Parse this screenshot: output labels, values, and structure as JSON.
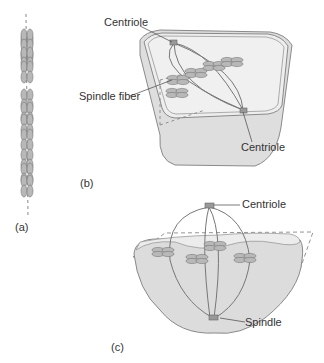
{
  "panels": {
    "a": {
      "label": "(a)"
    },
    "b": {
      "label": "(b)",
      "callouts": {
        "centriole_top": "Centriole",
        "spindle_fiber": "Spindle fiber",
        "centriole_bottom": "Centriole"
      }
    },
    "c": {
      "label": "(c)",
      "callouts": {
        "centriole": "Centriole",
        "spindle": "Spindle"
      }
    }
  },
  "colors": {
    "cell_fill": "#e2e2e2",
    "cell_stroke": "#8a8a8a",
    "chromosome": "#b8b8b8",
    "dashed": "#888888",
    "text": "#333333"
  }
}
